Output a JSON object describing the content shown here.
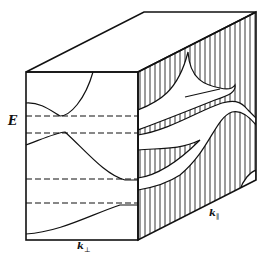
{
  "diagram": {
    "labels": {
      "energy_axis": "E",
      "k_perp": "k",
      "k_perp_sub": "⊥",
      "k_par": "k",
      "k_par_sub": "∥"
    },
    "dashed_levels_count": 4,
    "colors": {
      "ink": "#111111",
      "background": "#ffffff"
    }
  }
}
